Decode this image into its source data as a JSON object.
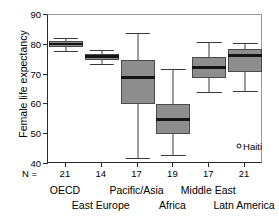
{
  "chart_data": {
    "type": "box",
    "title": "",
    "xlabel": "",
    "ylabel": "Female life expectancy",
    "ylim": [
      40,
      90
    ],
    "yticks": [
      40,
      50,
      60,
      70,
      80,
      90
    ],
    "ytick_labels": [
      "40",
      "50",
      "60",
      "70",
      "80",
      "90"
    ],
    "grid": false,
    "legend": "none",
    "n_prefix": "N =",
    "categories": [
      "OECD",
      "East Europe",
      "Pacific/Asia",
      "Africa",
      "Middle East",
      "Latn America"
    ],
    "counts": [
      "21",
      "14",
      "17",
      "19",
      "17",
      "21"
    ],
    "boxes": [
      {
        "category": "OECD",
        "n": 21,
        "whisker_low": 78.0,
        "q1": 79.4,
        "median": 80.3,
        "q3": 81.3,
        "whisker_high": 82.4
      },
      {
        "category": "East Europe",
        "n": 14,
        "whisker_low": 73.5,
        "q1": 75.0,
        "median": 76.0,
        "q3": 77.0,
        "whisker_high": 78.3
      },
      {
        "category": "Pacific/Asia",
        "n": 17,
        "whisker_low": 42.0,
        "q1": 60.0,
        "median": 69.0,
        "q3": 75.0,
        "whisker_high": 84.0
      },
      {
        "category": "Africa",
        "n": 19,
        "whisker_low": 43.0,
        "q1": 50.0,
        "median": 55.0,
        "q3": 60.0,
        "whisker_high": 72.0
      },
      {
        "category": "Middle East",
        "n": 17,
        "whisker_low": 64.0,
        "q1": 69.0,
        "median": 72.5,
        "q3": 76.0,
        "whisker_high": 81.0
      },
      {
        "category": "Latn America",
        "n": 21,
        "whisker_low": 64.5,
        "q1": 71.0,
        "median": 76.5,
        "q3": 78.5,
        "whisker_high": 80.5
      }
    ],
    "outliers": [
      {
        "category": "Latn America",
        "label": "Haiti",
        "value": 46.0
      }
    ],
    "colors": {
      "box_fill": "#8d8d8d",
      "box_edge": "#4a4a4a",
      "median": "#141414",
      "whisker": "#3a3a3a",
      "axis": "#2b2b2b",
      "frame": "#9a9a9a",
      "text": "#000000",
      "background": "#ffffff"
    }
  }
}
